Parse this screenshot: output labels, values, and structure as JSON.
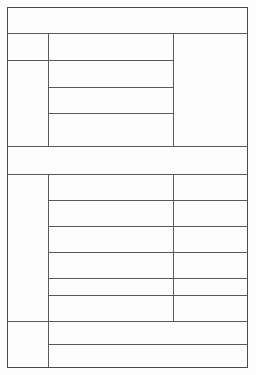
{
  "document": {
    "kind": "blank-ruled-form",
    "title": "",
    "description": "Blank ruled table form with no printed text",
    "page": {
      "width_px": 256,
      "height_px": 375,
      "background_color": "#fdfdfd"
    },
    "ink": {
      "rule_color": "#5a5a5a",
      "border_color": "#4a4a4a",
      "text_color": "#1a1a1a"
    },
    "grid": {
      "left_px": 7,
      "right_px": 248,
      "top_px": 7,
      "bottom_px": 367,
      "column_divider_1_px": 48,
      "column_divider_2_px": 173
    },
    "sections": [
      {
        "name": "header-band",
        "rows": [
          {
            "label": "",
            "cells": [
              {
                "text": ""
              }
            ]
          }
        ]
      },
      {
        "name": "upper-block",
        "rows": [
          {
            "label": "",
            "cells": [
              {
                "text": ""
              },
              {
                "text": ""
              },
              {
                "text": ""
              }
            ]
          },
          {
            "label": "",
            "cells": [
              {
                "text": ""
              },
              {
                "text": ""
              }
            ]
          },
          {
            "label": "",
            "cells": [
              {
                "text": ""
              }
            ]
          },
          {
            "label": "",
            "cells": [
              {
                "text": ""
              }
            ]
          }
        ]
      },
      {
        "name": "separator-band",
        "rows": [
          {
            "label": "",
            "cells": [
              {
                "text": ""
              }
            ]
          }
        ]
      },
      {
        "name": "body-block",
        "rows": [
          {
            "label": "",
            "cells": [
              {
                "text": ""
              },
              {
                "text": ""
              },
              {
                "text": ""
              }
            ]
          },
          {
            "label": "",
            "cells": [
              {
                "text": ""
              },
              {
                "text": ""
              }
            ]
          },
          {
            "label": "",
            "cells": [
              {
                "text": ""
              },
              {
                "text": ""
              }
            ]
          },
          {
            "label": "",
            "cells": [
              {
                "text": ""
              },
              {
                "text": ""
              }
            ]
          },
          {
            "label": "",
            "cells": [
              {
                "text": ""
              },
              {
                "text": ""
              }
            ]
          },
          {
            "label": "",
            "cells": [
              {
                "text": ""
              },
              {
                "text": ""
              }
            ]
          }
        ]
      },
      {
        "name": "footer-block",
        "rows": [
          {
            "label": "",
            "cells": [
              {
                "text": ""
              },
              {
                "text": ""
              }
            ]
          },
          {
            "label": "",
            "cells": [
              {
                "text": ""
              }
            ]
          }
        ]
      }
    ]
  }
}
